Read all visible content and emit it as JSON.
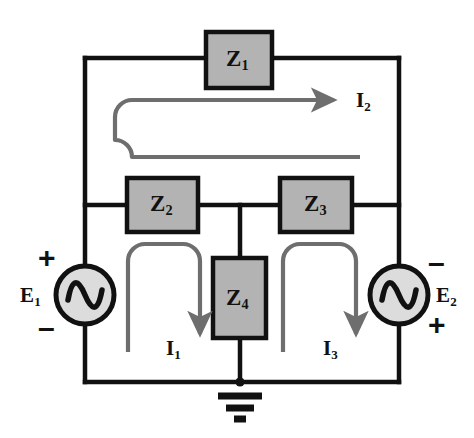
{
  "diagram": {
    "type": "electrical-schematic",
    "colors": {
      "wire": "#111111",
      "impedance_fill": "#b3b3b3",
      "impedance_border": "#111111",
      "source_fill": "#dcdcdc",
      "source_border": "#111111",
      "loop_arrow": "#6e6e6e",
      "background": "#ffffff"
    },
    "impedances": [
      {
        "id": "z1",
        "label": "Z",
        "sub": "1",
        "orientation": "horizontal",
        "x": 206,
        "y": 32,
        "w": 66,
        "h": 56
      },
      {
        "id": "z2",
        "label": "Z",
        "sub": "2",
        "orientation": "horizontal",
        "x": 127,
        "y": 178,
        "w": 71,
        "h": 54
      },
      {
        "id": "z3",
        "label": "Z",
        "sub": "3",
        "orientation": "horizontal",
        "x": 280,
        "y": 178,
        "w": 72,
        "h": 54
      },
      {
        "id": "z4",
        "label": "Z",
        "sub": "4",
        "orientation": "vertical",
        "x": 213,
        "y": 258,
        "w": 53,
        "h": 80
      }
    ],
    "sources": [
      {
        "id": "e1",
        "label": "E",
        "sub": "1",
        "symbol": "ac-source",
        "top_sign": "+",
        "bottom_sign": "–",
        "label_side": "left",
        "cx": 85,
        "cy": 295,
        "r": 29
      },
      {
        "id": "e2",
        "label": "E",
        "sub": "2",
        "symbol": "ac-source",
        "top_sign": "–",
        "bottom_sign": "+",
        "label_side": "right",
        "cx": 399,
        "cy": 295,
        "r": 29
      }
    ],
    "currents": [
      {
        "id": "i1",
        "label": "I",
        "sub": "1",
        "direction": "clockwise",
        "arrow": "down",
        "mesh": "left"
      },
      {
        "id": "i2",
        "label": "I",
        "sub": "2",
        "direction": "clockwise",
        "arrow": "right",
        "mesh": "outer-top"
      },
      {
        "id": "i3",
        "label": "I",
        "sub": "3",
        "direction": "clockwise",
        "arrow": "down",
        "mesh": "right"
      }
    ],
    "ground": {
      "id": "ground",
      "symbol": "earth-ground",
      "x": 240,
      "y": 382,
      "bars": 3
    },
    "frame": {
      "x": 85,
      "y": 58,
      "w": 314,
      "h": 324
    }
  }
}
